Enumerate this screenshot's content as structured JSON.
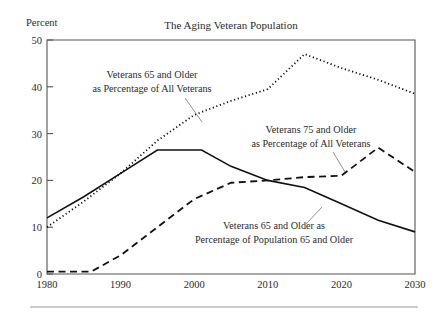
{
  "chart_data": {
    "type": "line",
    "title": "The Aging Veteran Population",
    "xlabel": "",
    "ylabel": "Percent",
    "xlim": [
      1980,
      2030
    ],
    "ylim": [
      0,
      50
    ],
    "xticks": [
      1980,
      1990,
      2000,
      2010,
      2020,
      2030
    ],
    "xtick_labels": [
      "1980",
      "1990",
      "2000",
      "2010",
      "2020",
      "2030"
    ],
    "yticks": [
      0,
      10,
      20,
      30,
      40,
      50
    ],
    "ytick_labels": [
      "0",
      "10",
      "20",
      "30",
      "40",
      "50"
    ],
    "grid": false,
    "legend": "annotations-inline",
    "series": [
      {
        "name": "Veterans 65 and Older as Percentage of All Veterans",
        "style": "dotted",
        "x": [
          1980,
          1985,
          1990,
          1995,
          2000,
          2005,
          2010,
          2015,
          2020,
          2025,
          2030
        ],
        "values": [
          10.0,
          15.5,
          21.5,
          28.5,
          34.0,
          37.0,
          39.5,
          47.0,
          44.0,
          41.5,
          38.5
        ]
      },
      {
        "name": "Veterans 65 and Older as Percentage of Population 65 and Older",
        "style": "solid",
        "x": [
          1980,
          1985,
          1990,
          1995,
          2001,
          2005,
          2010,
          2015,
          2020,
          2025,
          2030
        ],
        "values": [
          12.0,
          16.5,
          21.5,
          26.5,
          26.5,
          23.0,
          20.0,
          18.5,
          15.0,
          11.5,
          9.0
        ]
      },
      {
        "name": "Veterans 75 and Older as Percentage of All Veterans",
        "style": "dashed",
        "x": [
          1980,
          1986,
          1990,
          1995,
          2000,
          2005,
          2010,
          2015,
          2020,
          2025,
          2030
        ],
        "values": [
          0.5,
          0.5,
          4.0,
          10.0,
          16.0,
          19.5,
          20.0,
          20.7,
          21.0,
          27.0,
          21.8
        ]
      }
    ],
    "annotations": [
      {
        "id": "annot-dotted",
        "lines": [
          "Veterans 65 and Older",
          "as Percentage of All Veterans"
        ],
        "leader_from": [
          185,
          103
        ],
        "leader_to": [
          200,
          120
        ]
      },
      {
        "id": "annot-dashed",
        "lines": [
          "Veterans 75 and Older",
          "as Percentage of All Veterans"
        ],
        "leader_from": [
          330,
          148
        ],
        "leader_to": [
          342,
          168
        ]
      },
      {
        "id": "annot-solid",
        "lines": [
          "Veterans 65 and Older as",
          "Percentage of Population 65 and Older"
        ],
        "leader_from": [
          320,
          210
        ],
        "leader_to": [
          305,
          232
        ]
      }
    ]
  }
}
